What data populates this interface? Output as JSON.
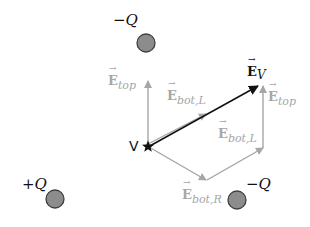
{
  "diagram": {
    "type": "electric-field-vector-superposition",
    "colors": {
      "charge_fill": "#8c8c8c",
      "charge_stroke": "#3f3f3f",
      "component_vector": "#a6a6a6",
      "resultant_vector": "#111111",
      "text": "#111111",
      "component_text": "#a6a6a6"
    },
    "charges": [
      {
        "id": "top",
        "label": "−Q",
        "sign": "negative"
      },
      {
        "id": "bottom-left",
        "label": "+Q",
        "sign": "positive"
      },
      {
        "id": "bottom-right",
        "label": "−Q",
        "sign": "negative"
      }
    ],
    "point": {
      "label": "V",
      "marker": "star-icon"
    },
    "vectors": {
      "e_top_left": {
        "symbol": "E",
        "subscript": "top"
      },
      "e_bot_l_upper": {
        "symbol": "E",
        "subscript": "bot,L"
      },
      "e_top_right": {
        "symbol": "E",
        "subscript": "top"
      },
      "e_bot_l_right": {
        "symbol": "E",
        "subscript": "bot,L"
      },
      "e_bot_r": {
        "symbol": "E",
        "subscript": "bot,R"
      },
      "e_v": {
        "symbol": "E",
        "subscript": "V"
      }
    }
  }
}
